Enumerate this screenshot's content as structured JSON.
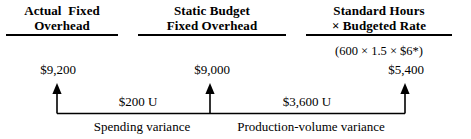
{
  "diagram": {
    "line_color": "#000000",
    "text_color": "#000000",
    "background_color": "#ffffff"
  },
  "columns": [
    {
      "id": "actual",
      "head_line_1": "Actual  Fixed",
      "head_line_2": "Overhead",
      "amount": "$9,200"
    },
    {
      "id": "static",
      "head_line_1": "Static Budget",
      "head_line_2": "Fixed Overhead",
      "amount": "$9,000"
    },
    {
      "id": "standard",
      "head_line_1": "Standard Hours",
      "head_line_2": "× Budgeted Rate",
      "formula": "(600 × 1.5 × $6*)",
      "amount": "$5,400"
    }
  ],
  "variances": [
    {
      "id": "spending",
      "amount": "$200 U",
      "label": "Spending variance"
    },
    {
      "id": "production-volume",
      "amount": "$3,600 U",
      "label": "Production-volume variance"
    }
  ]
}
